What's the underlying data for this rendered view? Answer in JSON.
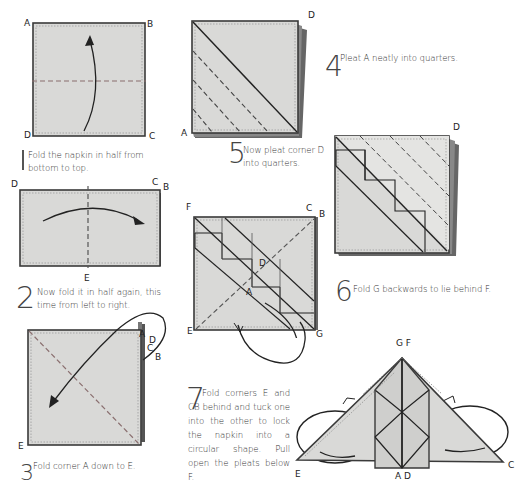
{
  "page": {
    "colors": {
      "napkin_fill": "#d9d9d7",
      "napkin_edge": "#3a3a3a",
      "text": "#333333",
      "background": "#ffffff"
    }
  },
  "steps": [
    {
      "number": "1",
      "text": "Fold the napkin in half from bottom to top.",
      "corner_labels": [
        "A",
        "B",
        "C",
        "D"
      ],
      "arrow": "bottom-to-top",
      "fold_line": "horizontal-dashed"
    },
    {
      "number": "2",
      "text": "Now fold it in half again, this time from left to right.",
      "corner_labels": [
        "D",
        "C",
        "B",
        "E"
      ],
      "arrow": "left-to-right",
      "fold_line": "vertical-dashed"
    },
    {
      "number": "3",
      "text": "Fold corner A down to E.",
      "corner_labels": [
        "A",
        "D",
        "C",
        "B",
        "E"
      ],
      "arrow": "top-right-to-bottom-left",
      "fold_line": "diagonal-dashed"
    },
    {
      "number": "4",
      "text": "Pleat A neatly into quarters.",
      "corner_labels": [
        "D",
        "A"
      ],
      "fold_line": "diagonal-pleats"
    },
    {
      "number": "5",
      "text": "Now pleat corner D into quarters.",
      "corner_labels": [
        "D"
      ],
      "fold_line": "diagonal-pleats"
    },
    {
      "number": "6",
      "text": "Fold G backwards to lie behind F.",
      "corner_labels": [
        "F",
        "C",
        "B",
        "D",
        "A",
        "E",
        "G"
      ],
      "arrow": "G-behind-to-F",
      "fold_line": "diagonal-dashed"
    },
    {
      "number": "7",
      "text": "Fold corners E and CB behind and tuck one into the other to lock the napkin into a circular shape. Pull open the pleats below F.",
      "corner_labels": [
        "G F",
        "E",
        "A D",
        "C"
      ]
    }
  ]
}
